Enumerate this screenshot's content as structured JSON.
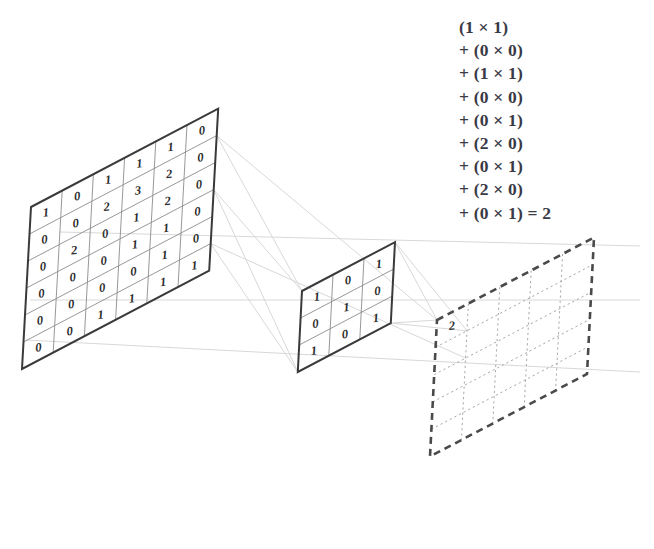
{
  "colors": {
    "outline": "#3a3a3a",
    "gridline": "#8c8c8c",
    "digit": "#2b2b2b",
    "projection": "#d8d8d8",
    "dashed_outline": "#4a4a4a",
    "dashed_grid": "#a8a8a8",
    "equation_text": "#3a3a46",
    "background": "#ffffff"
  },
  "input_matrix": {
    "name": "input-feature-map",
    "rows": 6,
    "cols": 6,
    "values": [
      [
        1,
        0,
        1,
        1,
        1,
        0
      ],
      [
        0,
        0,
        2,
        3,
        2,
        0
      ],
      [
        0,
        2,
        0,
        1,
        2,
        0
      ],
      [
        0,
        0,
        0,
        1,
        1,
        0
      ],
      [
        0,
        0,
        0,
        0,
        1,
        0
      ],
      [
        0,
        0,
        1,
        1,
        1,
        1
      ]
    ]
  },
  "kernel_matrix": {
    "name": "convolution-kernel",
    "rows": 3,
    "cols": 3,
    "values": [
      [
        1,
        0,
        1
      ],
      [
        0,
        1,
        0
      ],
      [
        1,
        0,
        1
      ]
    ]
  },
  "output_matrix": {
    "name": "output-feature-map",
    "rows": 5,
    "cols": 5,
    "style": "dashed",
    "values": [
      [
        "2",
        "",
        "",
        "",
        ""
      ],
      [
        "",
        "",
        "",
        "",
        ""
      ],
      [
        "",
        "",
        "",
        "",
        ""
      ],
      [
        "",
        "",
        "",
        "",
        ""
      ],
      [
        "",
        "",
        "",
        "",
        ""
      ]
    ]
  },
  "equation": {
    "name": "convolution-sum",
    "lines": [
      "(1 × 1)",
      "+ (0 × 0)",
      "+ (1 × 1)",
      "+ (0 × 0)",
      "+ (0 × 1)",
      "+ (2 × 0)",
      "+ (0 × 1)",
      "+ (2 × 0)",
      "+ (0 × 1) = 2"
    ],
    "result": "2"
  },
  "chart_data": {
    "type": "diagram",
    "input": [
      [
        1,
        0,
        1,
        1,
        1,
        0
      ],
      [
        0,
        0,
        2,
        3,
        2,
        0
      ],
      [
        0,
        2,
        0,
        1,
        2,
        0
      ],
      [
        0,
        0,
        0,
        1,
        1,
        0
      ],
      [
        0,
        0,
        0,
        0,
        1,
        0
      ],
      [
        0,
        0,
        1,
        1,
        1,
        1
      ]
    ],
    "kernel": [
      [
        1,
        0,
        1
      ],
      [
        0,
        1,
        0
      ],
      [
        1,
        0,
        1
      ]
    ],
    "output_known_values": {
      "r0c0": 2
    },
    "equation_terms": [
      [
        1,
        1
      ],
      [
        0,
        0
      ],
      [
        1,
        1
      ],
      [
        0,
        0
      ],
      [
        0,
        1
      ],
      [
        2,
        0
      ],
      [
        0,
        1
      ],
      [
        2,
        0
      ],
      [
        0,
        1
      ]
    ],
    "equation_result": 2
  }
}
